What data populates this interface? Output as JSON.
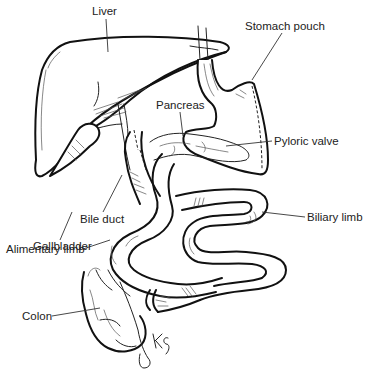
{
  "figure": {
    "labels": {
      "liver": "Liver",
      "stomach_pouch": "Stomach pouch",
      "pancreas": "Pancreas",
      "pyloric_valve": "Pyloric valve",
      "bile_duct": "Bile duct",
      "gallbladder": "Gallbladder",
      "biliary_limb": "Biliary limb",
      "alimentary_limb": "Alimentary limb",
      "colon": "Colon"
    },
    "signature": "KG",
    "colors": {
      "line": "#111111",
      "background": "#ffffff",
      "text": "#222222"
    }
  }
}
